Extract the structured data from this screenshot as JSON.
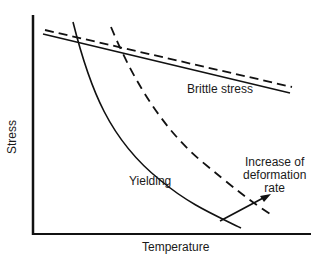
{
  "diagram": {
    "axes": {
      "x_label": "Temperature",
      "y_label": "Stress"
    },
    "labels": {
      "brittle": "Brittle stress",
      "yielding": "Yielding",
      "rate_line1": "Increase of",
      "rate_line2": "deformation",
      "rate_line3": "rate"
    },
    "colors": {
      "line": "#111111",
      "background": "#ffffff"
    }
  }
}
